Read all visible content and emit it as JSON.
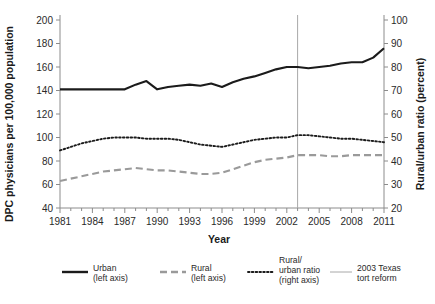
{
  "chart_data": {
    "type": "line",
    "title": "",
    "xlabel": "Year",
    "ylabel": "DPC physicians per 100,000 population",
    "ylabel_right": "Rural/urban ratio (percent)",
    "x": [
      1981,
      1982,
      1983,
      1984,
      1985,
      1986,
      1987,
      1988,
      1989,
      1990,
      1991,
      1992,
      1993,
      1994,
      1995,
      1996,
      1997,
      1998,
      1999,
      2000,
      2001,
      2002,
      2003,
      2004,
      2005,
      2006,
      2007,
      2008,
      2009,
      2010,
      2011
    ],
    "xlim": [
      1981,
      2011
    ],
    "ylim": [
      40,
      200
    ],
    "ylim_right": [
      20,
      100
    ],
    "yticks": [
      40,
      60,
      80,
      100,
      120,
      140,
      160,
      180,
      200
    ],
    "yticks_right": [
      20,
      30,
      40,
      50,
      60,
      70,
      80,
      90,
      100
    ],
    "xticks": [
      1981,
      1984,
      1987,
      1990,
      1993,
      1996,
      1999,
      2002,
      2005,
      2008,
      2011
    ],
    "xticks_minor_every": 1,
    "grid": false,
    "legend_position": "bottom",
    "series": [
      {
        "name": "Urban",
        "axis": "left",
        "style": "solid",
        "color": "#1b1b1b",
        "values": [
          141,
          141,
          141,
          141,
          141,
          141,
          141,
          145,
          148,
          141,
          143,
          144,
          145,
          144,
          146,
          143,
          147,
          150,
          152,
          155,
          158,
          160,
          160,
          159,
          160,
          161,
          163,
          164,
          164,
          168,
          176
        ]
      },
      {
        "name": "Rural",
        "axis": "left",
        "style": "dashed",
        "color": "#9a9a9a",
        "values": [
          63,
          65,
          67,
          69,
          71,
          72,
          73,
          74,
          73,
          72,
          72,
          71,
          70,
          69,
          69,
          70,
          73,
          76,
          79,
          81,
          82,
          83,
          85,
          85,
          85,
          84,
          84,
          85,
          85,
          85,
          85
        ]
      },
      {
        "name": "Rural/urban ratio",
        "axis": "right",
        "style": "dotted",
        "color": "#1b1b1b",
        "values": [
          44.5,
          46.0,
          47.5,
          48.5,
          49.5,
          50.0,
          50.0,
          50.0,
          49.5,
          49.5,
          49.5,
          49.0,
          48.0,
          47.0,
          46.5,
          46.0,
          47.0,
          48.0,
          49.0,
          49.5,
          50.0,
          50.0,
          51.0,
          51.0,
          50.5,
          50.0,
          49.5,
          49.5,
          49.0,
          48.5,
          48.0
        ]
      }
    ],
    "annotations": [
      {
        "name": "2003 Texas tort reform",
        "type": "vline",
        "x": 2003,
        "color": "#a8a8a8"
      }
    ]
  },
  "legend": {
    "items": [
      {
        "label_line1": "Urban",
        "label_line2": "(left axis)",
        "label_line3": ""
      },
      {
        "label_line1": "Rural",
        "label_line2": "(left axis)",
        "label_line3": ""
      },
      {
        "label_line1": "Rural/",
        "label_line2": "urban ratio",
        "label_line3": "(right axis)"
      },
      {
        "label_line1": "2003 Texas",
        "label_line2": "tort reform",
        "label_line3": ""
      }
    ]
  }
}
